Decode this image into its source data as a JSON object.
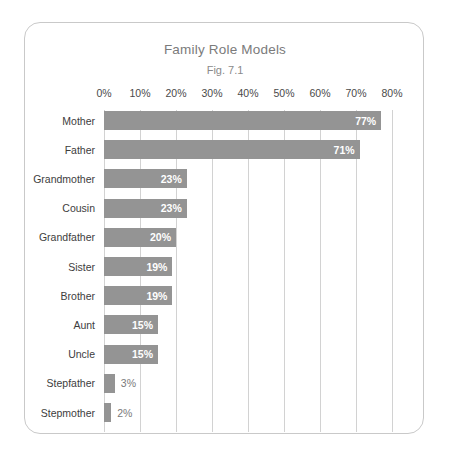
{
  "chart_data": {
    "type": "bar",
    "orientation": "horizontal",
    "title": "Family Role Models",
    "subtitle": "Fig. 7.1",
    "xlabel": "",
    "ylabel": "",
    "xlim": [
      0,
      80
    ],
    "xticks": [
      "0%",
      "10%",
      "20%",
      "30%",
      "40%",
      "50%",
      "60%",
      "70%",
      "80%"
    ],
    "xtick_values": [
      0,
      10,
      20,
      30,
      40,
      50,
      60,
      70,
      80
    ],
    "grid": true,
    "legend": "none",
    "categories": [
      "Mother",
      "Father",
      "Grandmother",
      "Cousin",
      "Grandfather",
      "Sister",
      "Brother",
      "Aunt",
      "Uncle",
      "Stepfather",
      "Stepmother"
    ],
    "values": [
      77,
      71,
      23,
      23,
      20,
      19,
      19,
      15,
      15,
      3,
      2
    ],
    "value_labels": [
      "77%",
      "71%",
      "23%",
      "23%",
      "20%",
      "19%",
      "19%",
      "15%",
      "15%",
      "3%",
      "2%"
    ],
    "label_placement": [
      "inside",
      "inside",
      "inside",
      "inside",
      "inside",
      "inside",
      "inside",
      "inside",
      "inside",
      "outside",
      "outside"
    ],
    "colors": {
      "bar": "#949494",
      "gridline": "#d2d2d2",
      "title_text": "#7b7b7b",
      "category_text": "#3d3d3d",
      "inside_label_text": "#ffffff",
      "outside_label_text": "#7a7a7a",
      "card_border": "#c9c9c9",
      "background": "#ffffff"
    }
  }
}
